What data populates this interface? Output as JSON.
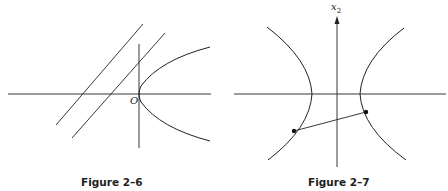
{
  "figures": [
    {
      "caption": "Figure 2–6",
      "origin_label": "O",
      "elements": [
        "x-axis",
        "y-axis",
        "parabola opening right with vertex at origin",
        "two parallel lines with positive slope"
      ]
    },
    {
      "caption": "Figure 2–7",
      "axis_label": "x",
      "axis_label_sub": "2",
      "elements": [
        "x-axis",
        "vertical axis with arrow",
        "hyperbola with two branches",
        "segment joining a point on each branch"
      ]
    }
  ]
}
